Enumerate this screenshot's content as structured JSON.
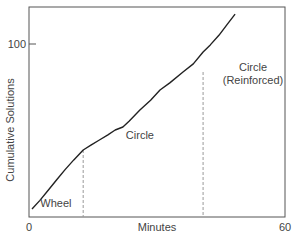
{
  "chart_data": {
    "type": "line",
    "title": "",
    "xlabel": "Minutes",
    "ylabel": "Cumulative Solutions",
    "xlim": [
      0,
      60
    ],
    "ylim": [
      0,
      120
    ],
    "x_ticks": [
      {
        "value": 0,
        "label": "0"
      },
      {
        "value": 60,
        "label": "60"
      }
    ],
    "y_ticks": [
      {
        "value": 100,
        "label": "100"
      }
    ],
    "grid": false,
    "legend": "none",
    "series": [
      {
        "name": "Cumulative Solutions",
        "color": "#222222",
        "points": [
          [
            0.7,
            4.6
          ],
          [
            2.5,
            9.5
          ],
          [
            4.5,
            15.5
          ],
          [
            6.5,
            21.5
          ],
          [
            8.5,
            27.5
          ],
          [
            10.5,
            33
          ],
          [
            12.7,
            38.7
          ],
          [
            14.5,
            41.5
          ],
          [
            16.5,
            44.5
          ],
          [
            18.5,
            47.5
          ],
          [
            20.2,
            50.3
          ],
          [
            22,
            52
          ],
          [
            23.5,
            55.5
          ],
          [
            26,
            61.8
          ],
          [
            28.5,
            67.5
          ],
          [
            30.7,
            73.4
          ],
          [
            33,
            77.5
          ],
          [
            36.1,
            83.8
          ],
          [
            38.5,
            88.5
          ],
          [
            40.8,
            95.4
          ],
          [
            42.5,
            99.5
          ],
          [
            44.5,
            105
          ],
          [
            46.5,
            111.5
          ],
          [
            48.3,
            117.3
          ]
        ]
      }
    ],
    "vertical_markers": [
      {
        "x": 12.7,
        "style": "dashed",
        "color": "#999999"
      },
      {
        "x": 40.8,
        "style": "dashed",
        "color": "#999999"
      }
    ],
    "annotations": [
      {
        "text": "Wheel",
        "x": 6.3,
        "y": 6
      },
      {
        "text": "Circle",
        "x": 26,
        "y": 45
      },
      {
        "text": "Circle",
        "x": 52.5,
        "y": 84.5
      },
      {
        "text": "(Reinforced)",
        "x": 52.5,
        "y": 77
      }
    ]
  }
}
